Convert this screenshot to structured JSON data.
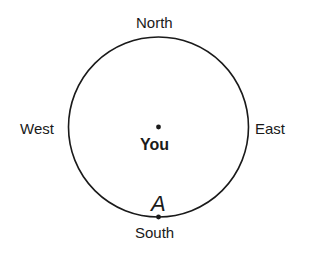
{
  "diagram": {
    "directions": {
      "north": "North",
      "south": "South",
      "east": "East",
      "west": "West"
    },
    "center_label": "You",
    "point_label": "A",
    "stroke_color": "#1a1a1a",
    "background": "#ffffff"
  }
}
